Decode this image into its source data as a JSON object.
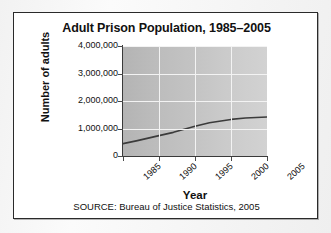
{
  "figure": {
    "title": "Adult Prison Population, 1985–2005",
    "source_note": "SOURCE: Bureau of Justice Statistics, 2005"
  },
  "colors": {
    "frame_border": "#2a2a2a",
    "plot_background": "#c2c2c2",
    "gridline": "#f3f3f3",
    "axis": "#3a3a3a",
    "data_line": "#3b3b3b",
    "text": "#111111",
    "page_background": "#f4f4f4"
  },
  "chart_data": {
    "type": "line",
    "title": "Adult Prison Population, 1985–2005",
    "xlabel": "Year",
    "ylabel": "Number of adults",
    "x": [
      1985,
      1990,
      1995,
      2000,
      2005
    ],
    "xtick_labels": [
      "1985",
      "1990",
      "1995",
      "2000",
      "2005"
    ],
    "ytick_values": [
      0,
      1000000,
      2000000,
      3000000,
      4000000
    ],
    "ytick_labels": [
      "0",
      "1,000,000",
      "2,000,000",
      "3,000,000",
      "4,000,000"
    ],
    "xlim": [
      1985,
      2005
    ],
    "ylim": [
      0,
      4000000
    ],
    "grid": true,
    "legend": null,
    "series": [
      {
        "name": "Adult prison population",
        "x": [
          1985,
          1987,
          1990,
          1992,
          1995,
          1997,
          2000,
          2002,
          2005
        ],
        "values": [
          450000,
          560000,
          740000,
          860000,
          1080000,
          1210000,
          1330000,
          1380000,
          1420000
        ]
      }
    ]
  }
}
